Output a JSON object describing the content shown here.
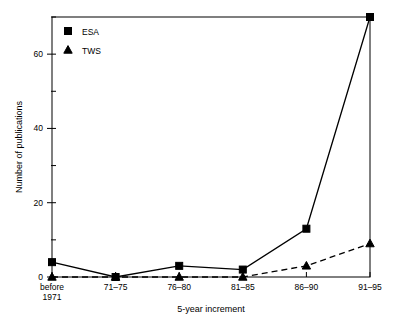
{
  "chart_data": {
    "type": "line",
    "title": "",
    "xlabel": "5-year increment",
    "ylabel": "Number of publications",
    "categories": [
      "before\n1971",
      "71–75",
      "76–80",
      "81–85",
      "86–90",
      "91–95"
    ],
    "category_labels": [
      {
        "line1": "before",
        "line2": "1971"
      },
      {
        "line1": "71–75",
        "line2": ""
      },
      {
        "line1": "76–80",
        "line2": ""
      },
      {
        "line1": "81–85",
        "line2": ""
      },
      {
        "line1": "86–90",
        "line2": ""
      },
      {
        "line1": "91–95",
        "line2": ""
      }
    ],
    "series": [
      {
        "name": "ESA",
        "values": [
          4,
          0,
          3,
          2,
          13,
          70
        ],
        "marker": "square",
        "line_style": "solid",
        "color": "#000000"
      },
      {
        "name": "TWS",
        "values": [
          0,
          0,
          0,
          0,
          3,
          9
        ],
        "marker": "triangle",
        "line_style": "dashed",
        "color": "#000000"
      }
    ],
    "ylim": [
      0,
      70
    ],
    "y_major_ticks": [
      0,
      20,
      40,
      60
    ],
    "y_minor_ticks": [
      10,
      30,
      50,
      70
    ],
    "y_tick_labels": [
      "0",
      "20",
      "40",
      "60"
    ],
    "grid": false,
    "legend_position": "top-left",
    "frame": true
  },
  "legend": {
    "entries": [
      {
        "label": "ESA",
        "marker": "square"
      },
      {
        "label": "TWS",
        "marker": "triangle"
      }
    ]
  },
  "axes": {
    "x_title": "5-year increment",
    "y_title": "Number of publications"
  }
}
